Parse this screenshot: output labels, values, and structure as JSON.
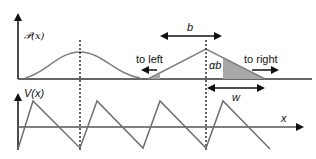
{
  "top_panel": {
    "y_label": "𝒫(x)",
    "gaussian": {
      "center_x": 80,
      "peak_y": 52
    },
    "triangle": {
      "apex": [
        206,
        49
      ],
      "left": [
        148,
        79
      ],
      "right": [
        265,
        79
      ]
    },
    "labels": {
      "b": "b",
      "to_left": "to left",
      "to_right": "to right",
      "alpha_b": "αb"
    }
  },
  "bottom_panel": {
    "y_label": "V(x)",
    "x_label": "x",
    "w_label": "w",
    "sawtooth_points": [
      [
        18,
        149
      ],
      [
        33,
        101
      ],
      [
        80,
        148
      ],
      [
        97,
        101
      ],
      [
        143,
        148
      ],
      [
        160,
        101
      ],
      [
        206,
        148
      ],
      [
        223,
        101
      ],
      [
        270,
        149
      ]
    ]
  },
  "colors": {
    "curve": "#808080",
    "axis": "#111111",
    "shade": "#a8a8a8"
  }
}
